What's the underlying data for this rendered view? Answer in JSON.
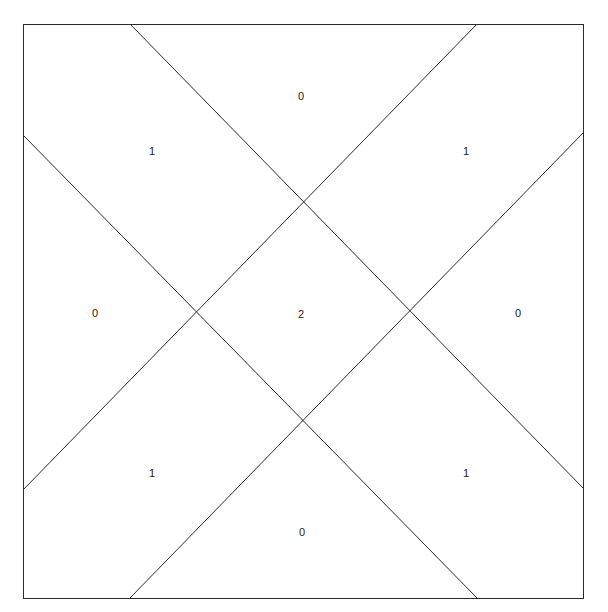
{
  "figure": {
    "canvas": {
      "width": 608,
      "height": 612
    },
    "background_color": "#ffffff",
    "stroke_color": "#2b2b2b",
    "stroke_width": 1,
    "label_color": "#1a1a1a",
    "label_font_size": 11
  },
  "chart_data": {
    "type": "diagram",
    "title": "",
    "xlabel": "",
    "ylabel": "",
    "grid": false,
    "legend": null,
    "xlim": [
      0,
      608
    ],
    "ylim": [
      0,
      612
    ],
    "bounding_square": {
      "name": "outer-square",
      "x": 23,
      "y": 24,
      "width": 560,
      "height": 574,
      "points": "23,24 583,24 583,598 23,598"
    },
    "lines": [
      {
        "name": "diagonal-down-left",
        "x1": 23,
        "y1": 135,
        "x2": 477,
        "y2": 598
      },
      {
        "name": "diagonal-down-right",
        "x1": 130,
        "y1": 24,
        "x2": 583,
        "y2": 488
      },
      {
        "name": "diagonal-up-left",
        "x1": 23,
        "y1": 490,
        "x2": 477,
        "y2": 24
      },
      {
        "name": "diagonal-up-right",
        "x1": 130,
        "y1": 598,
        "x2": 583,
        "y2": 133
      }
    ],
    "intersections": [
      {
        "name": "crossing-top",
        "x": 299,
        "y": 202
      },
      {
        "name": "crossing-bottom",
        "x": 300,
        "y": 420
      },
      {
        "name": "crossing-left",
        "x": 195,
        "y": 310
      },
      {
        "name": "crossing-right",
        "x": 405,
        "y": 310
      }
    ],
    "categories": [
      "top",
      "top-left",
      "top-right",
      "left",
      "center",
      "right",
      "bottom-left",
      "bottom-right",
      "bottom"
    ],
    "values": [
      0,
      1,
      1,
      0,
      2,
      0,
      1,
      1,
      0
    ],
    "region_labels": [
      {
        "name": "region-label-top",
        "region": "top",
        "value": "0",
        "x": 301,
        "y": 97
      },
      {
        "name": "region-label-top-left",
        "region": "top-left",
        "value": "1",
        "x": 152,
        "y": 152
      },
      {
        "name": "region-label-top-right",
        "region": "top-right",
        "value": "1",
        "x": 466,
        "y": 152
      },
      {
        "name": "region-label-left",
        "region": "left",
        "value": "0",
        "x": 95,
        "y": 314
      },
      {
        "name": "region-label-center",
        "region": "center",
        "value": "2",
        "x": 301,
        "y": 315
      },
      {
        "name": "region-label-right",
        "region": "right",
        "value": "0",
        "x": 518,
        "y": 314
      },
      {
        "name": "region-label-bottom-left",
        "region": "bottom-left",
        "value": "1",
        "x": 152,
        "y": 474
      },
      {
        "name": "region-label-bottom-right",
        "region": "bottom-right",
        "value": "1",
        "x": 466,
        "y": 474
      },
      {
        "name": "region-label-bottom",
        "region": "bottom",
        "value": "0",
        "x": 302,
        "y": 533
      }
    ]
  }
}
